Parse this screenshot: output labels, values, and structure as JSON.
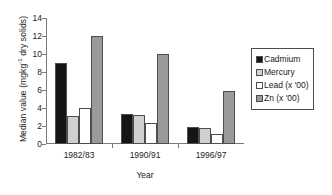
{
  "chart_data": {
    "type": "bar",
    "title": "",
    "xlabel": "Year",
    "ylabel_prefix": "Median value (mgkg",
    "ylabel_sup": "-1",
    "ylabel_suffix": " dry solids)",
    "ylabel_plain": "Median value (mgkg-1 dry solids)",
    "categories": [
      "1982/83",
      "1990/91",
      "1996/97"
    ],
    "ylim": [
      0,
      14
    ],
    "ytick_step": 2,
    "yticks": [
      "0",
      "2",
      "4",
      "6",
      "8",
      "10",
      "12",
      "14"
    ],
    "grid": false,
    "legend_position": "right",
    "series": [
      {
        "name": "Cadmium",
        "color": "#151515",
        "values": [
          9.0,
          3.3,
          1.9
        ]
      },
      {
        "name": "Mercury",
        "color": "#d0d0d0",
        "values": [
          3.1,
          3.2,
          1.8
        ]
      },
      {
        "name": "Lead (x '00)",
        "color": "#ffffff",
        "values": [
          4.0,
          2.3,
          1.1
        ]
      },
      {
        "name": "Zn (x '00)",
        "color": "#9a9a9a",
        "values": [
          12.0,
          10.0,
          5.9
        ]
      }
    ]
  }
}
